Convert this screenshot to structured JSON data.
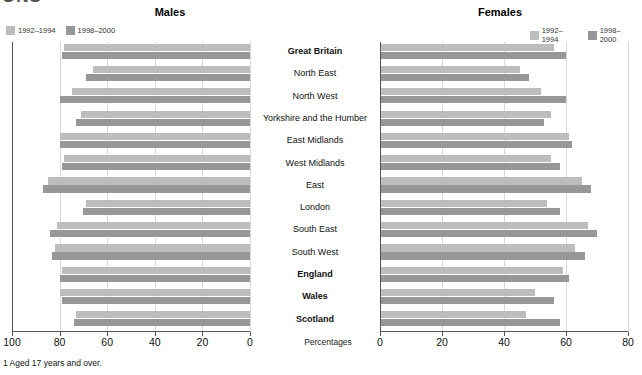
{
  "logo": {
    "text": "ONS"
  },
  "panels": {
    "males": {
      "title": "Males"
    },
    "females": {
      "title": "Females"
    }
  },
  "legend": {
    "series_a": "1992–1994",
    "series_b": "1998–2000",
    "color_a": "#bdbdbd",
    "color_b": "#979797"
  },
  "axis_caption": "Percentages",
  "footnote": "1 Aged 17 years and over.",
  "chart_data": {
    "type": "bar",
    "orientation": "horizontal",
    "layout": "back-to-back paired panels",
    "title": "",
    "xlabel": "Percentages",
    "ylabel": "",
    "grid": true,
    "legend_position": "top-left of each panel",
    "categories": [
      "Great Britain",
      "North East",
      "North West",
      "Yorkshire and the Humber",
      "East Midlands",
      "West Midlands",
      "East",
      "London",
      "South East",
      "South West",
      "England",
      "Wales",
      "Scotland"
    ],
    "bold_categories": [
      "Great Britain",
      "England",
      "Wales",
      "Scotland"
    ],
    "panels": [
      {
        "name": "Males",
        "xlim": [
          100,
          0
        ],
        "xticks": [
          100,
          80,
          60,
          40,
          20,
          0
        ],
        "axis_reversed": true,
        "series": [
          {
            "name": "1992–1994",
            "color": "#bdbdbd",
            "values": [
              78,
              66,
              75,
              71,
              80,
              78,
              85,
              69,
              81,
              82,
              79,
              80,
              73
            ]
          },
          {
            "name": "1998–2000",
            "color": "#979797",
            "values": [
              79,
              69,
              80,
              73,
              80,
              79,
              87,
              70,
              84,
              83,
              80,
              79,
              74
            ]
          }
        ]
      },
      {
        "name": "Females",
        "xlim": [
          0,
          80
        ],
        "xticks": [
          0,
          20,
          40,
          60,
          80
        ],
        "axis_reversed": false,
        "series": [
          {
            "name": "1992–1994",
            "color": "#bdbdbd",
            "values": [
              56,
              45,
              52,
              55,
              61,
              55,
              65,
              54,
              67,
              63,
              59,
              50,
              47
            ]
          },
          {
            "name": "1998–2000",
            "color": "#979797",
            "values": [
              60,
              48,
              60,
              53,
              62,
              58,
              68,
              58,
              70,
              66,
              61,
              56,
              58
            ]
          }
        ]
      }
    ]
  }
}
